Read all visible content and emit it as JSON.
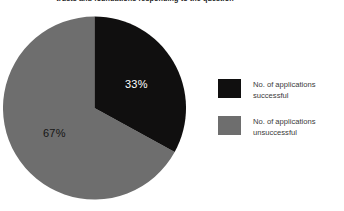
{
  "chart_data": {
    "type": "pie",
    "title": "trusts and foundations responding to the question",
    "categories": [
      "No. of applications successful",
      "No. of applications unsuccessful"
    ],
    "values": [
      33,
      67
    ],
    "value_labels": [
      "33%",
      "67%"
    ],
    "colors": [
      "#100f0f",
      "#6e6e6e"
    ],
    "start_angle_deg": 0,
    "direction": "clockwise",
    "legend_position": "right",
    "grid": false,
    "xlabel": "",
    "ylabel": ""
  },
  "title": {
    "text": "trusts and foundations responding to the question"
  },
  "pie": {
    "slices": [
      {
        "name": "No. of applications successful",
        "percent_label": "33%",
        "value": 33,
        "color": "#100f0f",
        "label_color": "#ffffff"
      },
      {
        "name": "No. of applications unsuccessful",
        "percent_label": "67%",
        "value": 67,
        "color": "#6e6e6e",
        "label_color": "#151515"
      }
    ]
  },
  "legend": {
    "items": [
      {
        "line1": "No. of applications",
        "line2": "successful",
        "color": "#100f0f"
      },
      {
        "line1": "No. of applications",
        "line2": "unsuccessful",
        "color": "#6e6e6e"
      }
    ]
  }
}
